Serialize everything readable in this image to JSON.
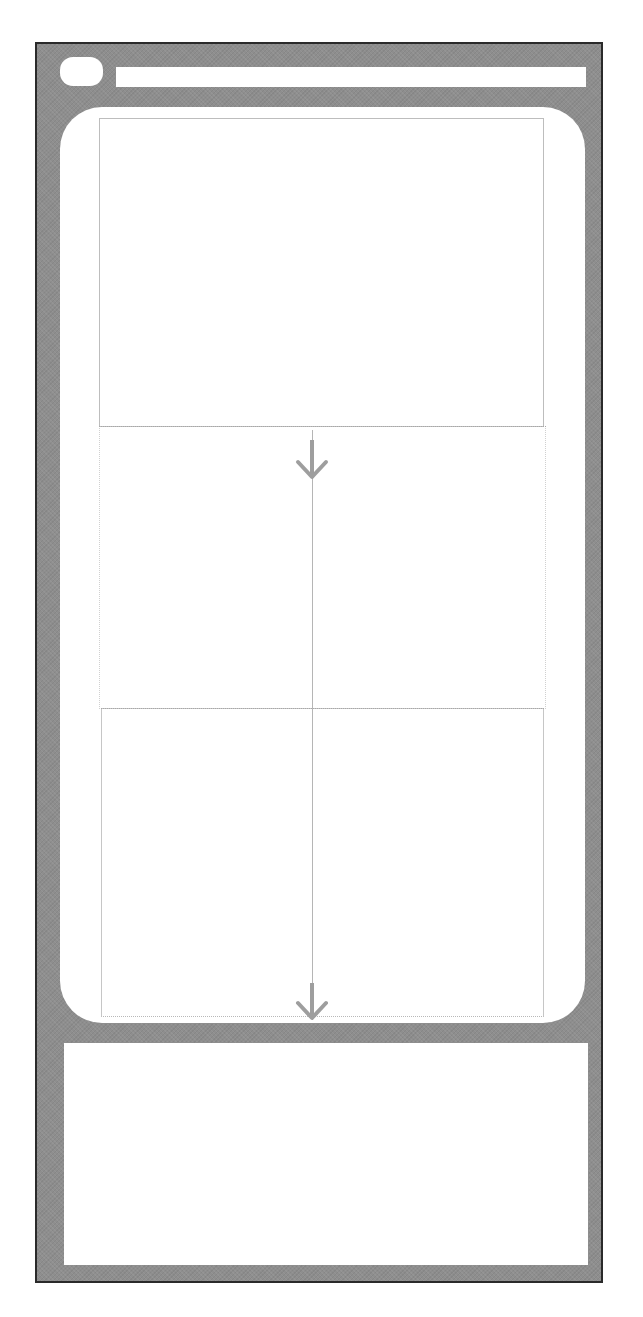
{
  "diagram": {
    "type": "scroll-flow-wireframe",
    "description_elements": {
      "frame": {
        "name": "device-frame"
      },
      "header": {
        "home_pill": {
          "name": "home-pill"
        },
        "top_bar": {
          "name": "top-bar"
        }
      },
      "main_panel": {
        "screens": [
          {
            "name": "screen-top",
            "border": "solid"
          },
          {
            "name": "screen-middle",
            "border": "dotted"
          },
          {
            "name": "screen-bottom",
            "border": "solid"
          }
        ],
        "flow": {
          "direction": "down",
          "arrows": [
            {
              "name": "arrow-down-top"
            },
            {
              "name": "arrow-down-bottom"
            }
          ]
        }
      },
      "bottom_panel": {
        "name": "bottom-panel"
      }
    },
    "colors": {
      "frame_fill": "#8e8e8e",
      "frame_border": "#2a2a2a",
      "panel_fill": "#ffffff",
      "guide_line": "#b5b5b5",
      "arrow": "#9e9e9e"
    }
  }
}
